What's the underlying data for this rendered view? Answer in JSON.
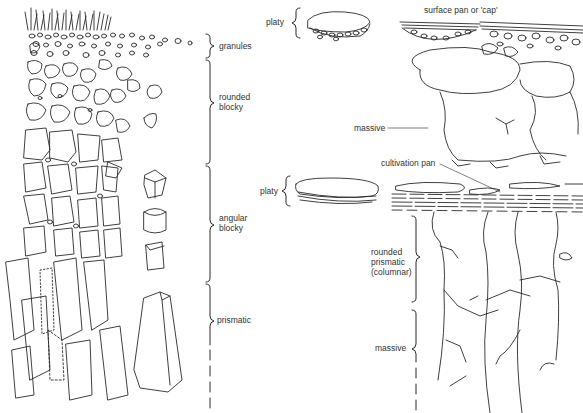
{
  "left_profile": {
    "labels": [
      {
        "id": "granules",
        "text": "granules"
      },
      {
        "id": "rounded-blocky",
        "line1": "rounded",
        "line2": "blocky"
      },
      {
        "id": "angular-blocky",
        "line1": "angular",
        "line2": "blocky"
      },
      {
        "id": "prismatic",
        "text": "prismatic"
      }
    ]
  },
  "right_profile": {
    "labels": [
      {
        "id": "platy-top",
        "text": "platy"
      },
      {
        "id": "surface-pan",
        "text": "surface pan or 'cap'"
      },
      {
        "id": "massive-top",
        "text": "massive"
      },
      {
        "id": "cultivation-pan",
        "text": "cultivation pan"
      },
      {
        "id": "platy-mid",
        "text": "platy"
      },
      {
        "id": "rounded-prismatic",
        "line1": "rounded",
        "line2": "prismatic",
        "line3": "(columnar)"
      },
      {
        "id": "massive-bottom",
        "text": "massive"
      }
    ]
  },
  "colors": {
    "ink": "#2a2a2a",
    "background": "#ffffff"
  }
}
